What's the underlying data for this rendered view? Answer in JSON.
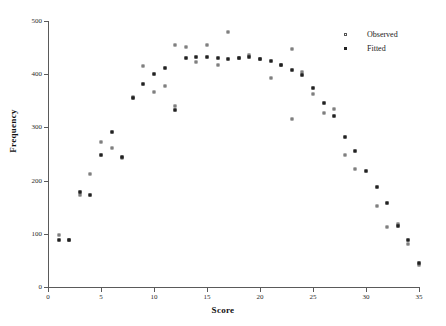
{
  "chart_data": {
    "type": "scatter",
    "title": "",
    "xlabel": "Score",
    "ylabel": "Frequency",
    "xlim": [
      0,
      35
    ],
    "ylim": [
      0,
      500
    ],
    "xticks": [
      0,
      5,
      10,
      15,
      20,
      25,
      30,
      35
    ],
    "yticks": [
      0,
      100,
      200,
      300,
      400,
      500
    ],
    "grid": false,
    "legend_position": "top-right",
    "series": [
      {
        "name": "Observed",
        "marker": "open-square",
        "color": "#555555",
        "points": [
          [
            1,
            98
          ],
          [
            2,
            88
          ],
          [
            3,
            172
          ],
          [
            4,
            212
          ],
          [
            5,
            272
          ],
          [
            6,
            262
          ],
          [
            7,
            242
          ],
          [
            8,
            357
          ],
          [
            9,
            415
          ],
          [
            10,
            367
          ],
          [
            11,
            378
          ],
          [
            12,
            455
          ],
          [
            12,
            340
          ],
          [
            13,
            452
          ],
          [
            14,
            422
          ],
          [
            15,
            455
          ],
          [
            16,
            418
          ],
          [
            17,
            480
          ],
          [
            18,
            430
          ],
          [
            19,
            437
          ],
          [
            20,
            428
          ],
          [
            21,
            392
          ],
          [
            22,
            418
          ],
          [
            23,
            447
          ],
          [
            23,
            315
          ],
          [
            24,
            404
          ],
          [
            25,
            362
          ],
          [
            26,
            327
          ],
          [
            27,
            335
          ],
          [
            28,
            248
          ],
          [
            29,
            222
          ],
          [
            31,
            152
          ],
          [
            32,
            112
          ],
          [
            33,
            118
          ],
          [
            34,
            80
          ],
          [
            35,
            42
          ]
        ]
      },
      {
        "name": "Fitted",
        "marker": "filled-square",
        "color": "#222222",
        "points": [
          [
            1,
            88
          ],
          [
            2,
            88
          ],
          [
            3,
            178
          ],
          [
            4,
            172
          ],
          [
            5,
            248
          ],
          [
            6,
            292
          ],
          [
            7,
            245
          ],
          [
            8,
            355
          ],
          [
            9,
            382
          ],
          [
            10,
            400
          ],
          [
            11,
            412
          ],
          [
            12,
            332
          ],
          [
            13,
            430
          ],
          [
            14,
            432
          ],
          [
            15,
            432
          ],
          [
            16,
            430
          ],
          [
            17,
            428
          ],
          [
            18,
            430
          ],
          [
            19,
            432
          ],
          [
            20,
            428
          ],
          [
            21,
            425
          ],
          [
            22,
            418
          ],
          [
            23,
            408
          ],
          [
            24,
            398
          ],
          [
            25,
            375
          ],
          [
            26,
            345
          ],
          [
            27,
            322
          ],
          [
            28,
            282
          ],
          [
            29,
            255
          ],
          [
            30,
            218
          ],
          [
            31,
            188
          ],
          [
            32,
            158
          ],
          [
            33,
            115
          ],
          [
            34,
            88
          ],
          [
            35,
            45
          ]
        ]
      }
    ]
  },
  "legend": {
    "entries": [
      {
        "label": "Observed"
      },
      {
        "label": "Fitted"
      }
    ]
  }
}
